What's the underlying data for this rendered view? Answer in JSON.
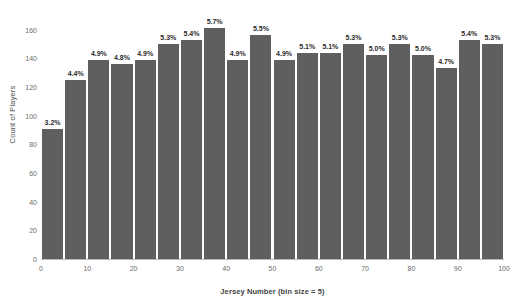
{
  "chart_data": {
    "type": "bar",
    "title": "",
    "xlabel": "Jersey Number (bin size = 5)",
    "ylabel": "Count of Players",
    "xlim": [
      0,
      100
    ],
    "ylim": [
      0,
      166
    ],
    "grid": false,
    "legend": null,
    "bar_color": "#5f5f5f",
    "bin_size": 5,
    "x_ticks": [
      0,
      10,
      20,
      30,
      40,
      50,
      60,
      70,
      80,
      90,
      100
    ],
    "x_tick_labels": [
      "0",
      "10",
      "20",
      "30",
      "40",
      "50",
      "60",
      "70",
      "80",
      "90",
      "100"
    ],
    "y_ticks": [
      0,
      20,
      40,
      60,
      80,
      100,
      120,
      140,
      160
    ],
    "y_tick_labels": [
      "0",
      "20",
      "40",
      "60",
      "80",
      "100",
      "120",
      "140",
      "160"
    ],
    "categories": [
      "0-5",
      "5-10",
      "10-15",
      "15-20",
      "20-25",
      "25-30",
      "30-35",
      "35-40",
      "40-45",
      "45-50",
      "50-55",
      "55-60",
      "60-65",
      "65-70",
      "70-75",
      "75-80",
      "80-85",
      "85-90",
      "90-95",
      "95-100"
    ],
    "bin_starts": [
      0,
      5,
      10,
      15,
      20,
      25,
      30,
      35,
      40,
      45,
      50,
      55,
      60,
      65,
      70,
      75,
      80,
      85,
      90,
      95
    ],
    "bin_ends": [
      5,
      10,
      15,
      20,
      25,
      30,
      35,
      40,
      45,
      50,
      55,
      60,
      65,
      70,
      75,
      80,
      85,
      90,
      95,
      100
    ],
    "values": [
      91,
      125,
      139,
      136,
      139,
      150,
      153,
      161,
      139,
      156,
      139,
      144,
      144,
      150,
      142,
      150,
      142,
      133,
      153,
      150
    ],
    "data_labels": [
      "3.2%",
      "4.4%",
      "4.9%",
      "4.8%",
      "4.9%",
      "5.3%",
      "5.4%",
      "5.7%",
      "4.9%",
      "5.5%",
      "4.9%",
      "5.1%",
      "5.1%",
      "5.3%",
      "5.0%",
      "5.3%",
      "5.0%",
      "4.7%",
      "5.4%",
      "5.3%"
    ]
  }
}
